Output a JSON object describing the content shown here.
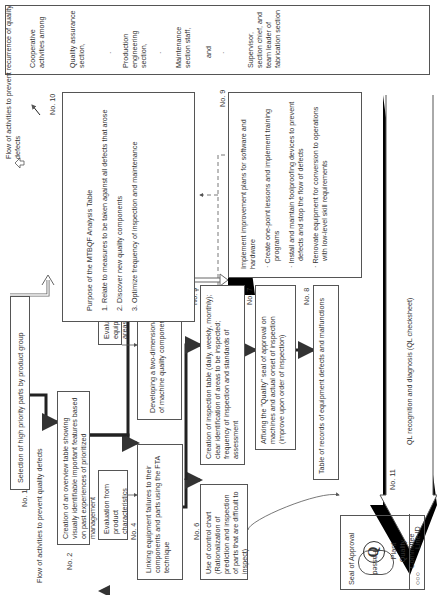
{
  "cooperative": {
    "title": "Cooperative activities among",
    "groups": [
      "Quality assurance section,",
      "Production engineering section,",
      "Maintenance section staff,",
      "and",
      "Supervisor, section chief, and team leader of fabrication section"
    ],
    "separator": "·"
  },
  "legend": {
    "recurrence": "Flow of activities to prevent recurrence of quality defects",
    "prevent": "Flow of activities to prevent quality defects"
  },
  "steps": {
    "no1": {
      "num": "No. 1",
      "text": "Selection of high priority parts by product group"
    },
    "no2": {
      "num": "No. 2",
      "text": "Creation of an overview table showing visually identifiable important features based on past experiences of prioritized management"
    },
    "no3": {
      "num": "No. 3",
      "text": "Developing a two-dimensional table of machine quality components",
      "input": "Evaluation from equipment failure areas"
    },
    "no4": {
      "num": "No. 4",
      "text": "Linking equipment failures to their components and parts using the FTA technique",
      "input": "Evaluation from product characteristics"
    },
    "no5": {
      "num": "No. 5",
      "text": "Creation of inspection table (daily, weekly, monthly); clear identification of areas to be inspected; frequency of inspection and standards of assessment"
    },
    "no6": {
      "num": "No. 6",
      "text": "Use of control chart (Rationalization of prediction and inspection of parts that are difficult to inspect)"
    },
    "no7": {
      "num": "No. 7",
      "text": "Affixing the \"Quality\" seal of approval on machines and actual onset of inspection (improve upon order of inspection)"
    },
    "no8": {
      "num": "No. 8",
      "text": "Table of records of equipment defects and malfunctions"
    },
    "no9": {
      "num": "No. 9",
      "title": "Implement improvement plans for software and hardware",
      "bullets": [
        "Create one-point lessons and implement training programs",
        "Install and maintain foolproofing devices to prevent defects and stop the flow of defects",
        "Renovate equipment for conversion to operations with low-level skill requirements"
      ]
    },
    "no10": {
      "num": "No. 10",
      "title": "Purpose of the MTBQF Analysis Table",
      "items": [
        {
          "n": "1.",
          "t": "Relate to measures to be taken against all defects that arose"
        },
        {
          "n": "2.",
          "t": "Discover new quality components"
        },
        {
          "n": "3.",
          "t": "Optimize frequency of inspection and maintenance"
        }
      ]
    },
    "no11": {
      "num": "No. 11",
      "text": "QL recognition and diagnosis (QL checksheet)"
    }
  },
  "passed": "Passed",
  "seal": {
    "title": "Seal of Approval",
    "symbol": "Q",
    "org": "Plant Quality Committee",
    "circles": "○○○",
    "line_id": "Line ID"
  }
}
